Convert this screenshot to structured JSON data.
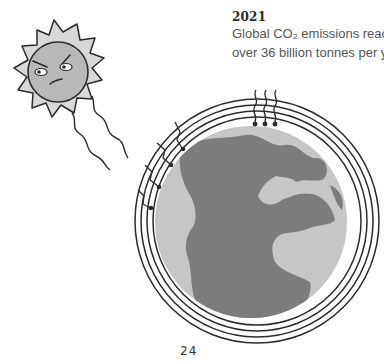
{
  "caption": {
    "year": "2021",
    "line1": "Global CO₂ emissions reach",
    "line2": "over 36 billion tonnes per year."
  },
  "page": {
    "number": "24"
  },
  "illustration": {
    "sun": {
      "icon": "angry-sun-icon",
      "mood": "angry"
    },
    "earth": {
      "icon": "earth-globe-icon",
      "atmosphere_rings": 4
    },
    "heat_rays": {
      "icon": "heat-waves-icon"
    },
    "colors": {
      "ink": "#2b2b2b",
      "sun_face": "#b8b8b8",
      "sun_rays": "#d8d8d8",
      "ocean": "#c6c6c6",
      "land": "#7c7c7c"
    }
  }
}
